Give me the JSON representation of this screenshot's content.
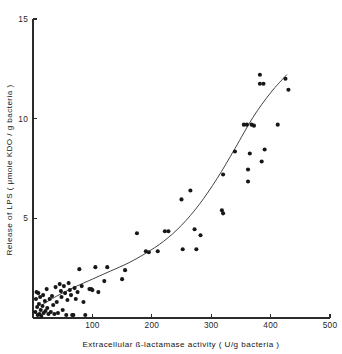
{
  "chart_data": {
    "type": "scatter",
    "title": "",
    "xlabel": "Extracellular ß-lactamase activity ( U/g bacteria )",
    "ylabel": "Release of LPS ( μmole KDO / g bacteria )",
    "xlim": [
      0,
      500
    ],
    "ylim": [
      0,
      15
    ],
    "xticks": [
      100,
      200,
      300,
      400,
      500
    ],
    "yticks": [
      5,
      10,
      15
    ],
    "xtick_labels": [
      "100",
      "200",
      "300",
      "400",
      "500"
    ],
    "ytick_labels": [
      "5",
      "10",
      "15"
    ],
    "grid": false,
    "legend": null,
    "marker": "filled-circle",
    "marker_color": "#171717",
    "curve_color": "#3a3a3a",
    "points": [
      [
        4,
        0.3
      ],
      [
        5,
        0.95
      ],
      [
        6,
        1.3
      ],
      [
        7,
        0.55
      ],
      [
        8,
        0.15
      ],
      [
        9,
        1.25
      ],
      [
        10,
        0.7
      ],
      [
        11,
        0.2
      ],
      [
        12,
        1.05
      ],
      [
        13,
        0.4
      ],
      [
        14,
        0.1
      ],
      [
        16,
        0.6
      ],
      [
        17,
        1.15
      ],
      [
        18,
        0.25
      ],
      [
        20,
        0.85
      ],
      [
        21,
        0.35
      ],
      [
        23,
        1.45
      ],
      [
        24,
        0.5
      ],
      [
        26,
        0.2
      ],
      [
        28,
        0.95
      ],
      [
        30,
        0.3
      ],
      [
        32,
        1.1
      ],
      [
        34,
        0.65
      ],
      [
        36,
        0.2
      ],
      [
        38,
        1.55
      ],
      [
        40,
        0.8
      ],
      [
        42,
        0.25
      ],
      [
        45,
        1.7
      ],
      [
        47,
        1.35
      ],
      [
        48,
        1.05
      ],
      [
        50,
        0.4
      ],
      [
        52,
        1.6
      ],
      [
        54,
        1.25
      ],
      [
        56,
        0.15
      ],
      [
        58,
        0.9
      ],
      [
        60,
        1.75
      ],
      [
        62,
        1.4
      ],
      [
        64,
        1.15
      ],
      [
        66,
        0.15
      ],
      [
        68,
        0.15
      ],
      [
        70,
        1.5
      ],
      [
        72,
        0.95
      ],
      [
        75,
        1.3
      ],
      [
        78,
        2.45
      ],
      [
        82,
        1.6
      ],
      [
        85,
        0.8
      ],
      [
        88,
        0.15
      ],
      [
        95,
        1.45
      ],
      [
        98,
        1.45
      ],
      [
        100,
        1.4
      ],
      [
        105,
        2.55
      ],
      [
        110,
        1.3
      ],
      [
        120,
        1.85
      ],
      [
        125,
        2.55
      ],
      [
        150,
        1.95
      ],
      [
        155,
        2.4
      ],
      [
        175,
        4.25
      ],
      [
        190,
        3.35
      ],
      [
        195,
        3.3
      ],
      [
        210,
        3.35
      ],
      [
        222,
        4.35
      ],
      [
        228,
        4.35
      ],
      [
        250,
        5.95
      ],
      [
        252,
        3.45
      ],
      [
        265,
        6.4
      ],
      [
        272,
        4.45
      ],
      [
        275,
        3.45
      ],
      [
        282,
        4.15
      ],
      [
        318,
        5.4
      ],
      [
        320,
        5.25
      ],
      [
        320,
        7.2
      ],
      [
        340,
        8.35
      ],
      [
        355,
        9.7
      ],
      [
        360,
        9.7
      ],
      [
        362,
        6.85
      ],
      [
        362,
        7.45
      ],
      [
        365,
        8.25
      ],
      [
        368,
        9.7
      ],
      [
        372,
        9.65
      ],
      [
        382,
        12.2
      ],
      [
        382,
        11.75
      ],
      [
        388,
        11.75
      ],
      [
        385,
        7.85
      ],
      [
        390,
        8.45
      ],
      [
        412,
        9.7
      ],
      [
        430,
        11.45
      ],
      [
        425,
        12.0
      ]
    ],
    "fit_curve": {
      "description": "monotonic upward-curving fitted line",
      "x_start": 15,
      "x_end": 427,
      "points": [
        [
          15,
          0.65
        ],
        [
          40,
          1.1
        ],
        [
          70,
          1.55
        ],
        [
          100,
          1.95
        ],
        [
          130,
          2.35
        ],
        [
          160,
          2.75
        ],
        [
          190,
          3.25
        ],
        [
          220,
          3.85
        ],
        [
          250,
          4.65
        ],
        [
          280,
          5.7
        ],
        [
          310,
          7.0
        ],
        [
          340,
          8.5
        ],
        [
          370,
          10.05
        ],
        [
          400,
          11.3
        ],
        [
          427,
          12.2
        ]
      ]
    }
  },
  "figure": {
    "background": "#ffffff",
    "axis_color": "#2b2b2b"
  }
}
